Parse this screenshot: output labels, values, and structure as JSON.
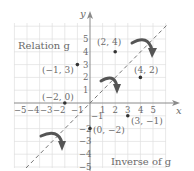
{
  "diagram": {
    "title_relation": "Relation g",
    "title_inverse": "Inverse of g",
    "axis_x_label": "x",
    "axis_y_label": "y",
    "x_ticks": [
      "−5",
      "−4",
      "−3",
      "−2",
      "−1",
      "1",
      "2",
      "3",
      "4",
      "5"
    ],
    "y_ticks": [
      "5",
      "4",
      "3",
      "2",
      "1",
      "−1",
      "−2",
      "−3",
      "−4",
      "−5"
    ],
    "relation_points": [
      {
        "label": "(2, 4)",
        "x": 2,
        "y": 4
      },
      {
        "label": "(−1, 3)",
        "x": -1,
        "y": 3
      },
      {
        "label": "(−2, 0)",
        "x": -2,
        "y": 0
      }
    ],
    "inverse_points": [
      {
        "label": "(4, 2)",
        "x": 4,
        "y": 2
      },
      {
        "label": "(3, −1)",
        "x": 3,
        "y": -1
      },
      {
        "label": "(0, −2)",
        "x": 0,
        "y": -2
      }
    ],
    "line_of_symmetry": "y = x",
    "colors": {
      "grid": "#dcdcdc",
      "axis": "#8a8a8a",
      "text": "#6a6a6a",
      "point": "#333333",
      "arrow": "#555555",
      "dashed_line": "#777777"
    }
  }
}
